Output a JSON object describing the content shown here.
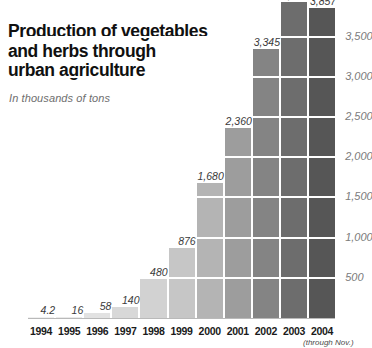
{
  "title": {
    "lines": [
      "Production of vegetables",
      "and herbs through",
      "urban agriculture"
    ],
    "subtitle": "In thousands of tons"
  },
  "footnote": "(through Nov.)",
  "chart_data": {
    "type": "bar",
    "title": "Production of vegetables and herbs through urban agriculture",
    "subtitle": "In thousands of tons",
    "xlabel": "",
    "ylabel": "In thousands of tons",
    "categories": [
      "1994",
      "1995",
      "1996",
      "1997",
      "1998",
      "1999",
      "2000",
      "2001",
      "2002",
      "2003",
      "2004"
    ],
    "values": [
      4.2,
      16,
      58,
      140,
      480,
      876,
      1680,
      2360,
      3345,
      3931,
      3857
    ],
    "data_labels": [
      "4.2",
      "16",
      "58",
      "140",
      "480",
      "876",
      "1,680",
      "2,360",
      "3,345",
      "3,931",
      "3,857"
    ],
    "bar_colors": [
      "#f0f0f0",
      "#eaeaea",
      "#e2e2e2",
      "#d8d8d8",
      "#d2d2d2",
      "#c6c6c6",
      "#b4b4b4",
      "#9d9d9d",
      "#848484",
      "#6d6d6d",
      "#565656"
    ],
    "ylim": [
      0,
      4100
    ],
    "ytick_values": [
      500,
      1000,
      1500,
      2000,
      2500,
      3000,
      3500
    ],
    "ytick_labels": [
      "500",
      "1,000",
      "1,500",
      "2,000",
      "2,500",
      "3,000",
      "3,500"
    ],
    "axis_position": "right",
    "grid": true,
    "gridline_color": "#ffffff",
    "legend": "none",
    "note": "2004 is through Nov."
  }
}
